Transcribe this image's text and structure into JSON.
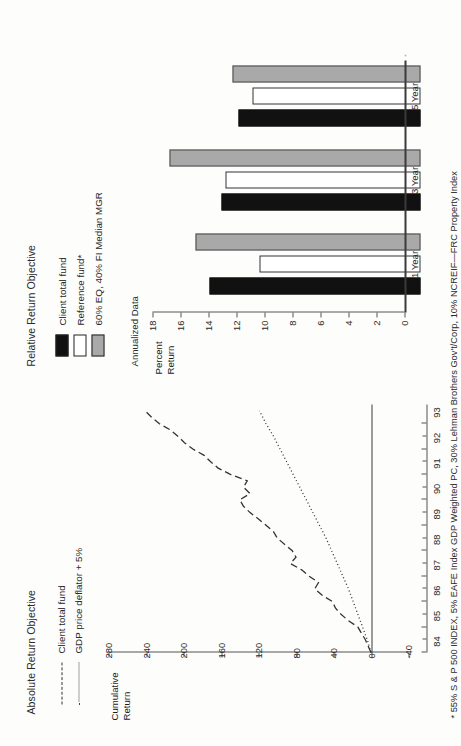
{
  "page": {
    "footnote": "* 55% S & P 500 INDEX, 5% EAFE Index GDP Weighted PC, 30% Lehman Brothers Gov't/Corp, 10% NCREIF—FRC Property Index"
  },
  "absolute_chart": {
    "title": "Absolute Return Objective",
    "ylabel_line1": "Cumulative",
    "ylabel_line2": "Return",
    "legend": [
      {
        "label": "Client total fund",
        "style": "dashed"
      },
      {
        "label": "GDP price deflator + 5%",
        "style": "dotted"
      }
    ]
  },
  "relative_chart": {
    "title": "Relative Return Objective",
    "subtitle": "Annualized Data",
    "ylabel_line1": "Percent",
    "ylabel_line2": "Return",
    "legend": [
      {
        "label": "Client total fund",
        "color": "#111111"
      },
      {
        "label": "Reference fund*",
        "color": "#ffffff"
      },
      {
        "label": "60% EQ, 40% FI Median MGR",
        "color": "#a9a9a9"
      }
    ]
  },
  "chart_data": [
    {
      "type": "line",
      "title": "Absolute Return Objective",
      "xlabel": "",
      "ylabel": "Cumulative Return",
      "ylim": [
        -40,
        280
      ],
      "yticks": [
        280,
        240,
        200,
        160,
        120,
        80,
        40,
        0,
        -40
      ],
      "xlim": [
        84,
        93.75
      ],
      "xticks": [
        84,
        85,
        86,
        87,
        88,
        89,
        90,
        91,
        92,
        93
      ],
      "xtick_labels": [
        "84",
        "85",
        "86",
        "87",
        "88",
        "89",
        "90",
        "91",
        "92",
        "93"
      ],
      "grid": false,
      "legend_position": "top-left",
      "series": [
        {
          "name": "Client total fund",
          "style": "dashed",
          "x": [
            84.0,
            84.25,
            84.5,
            84.75,
            85.0,
            85.25,
            85.5,
            85.75,
            86.0,
            86.25,
            86.5,
            86.75,
            87.0,
            87.25,
            87.5,
            87.75,
            88.0,
            88.25,
            88.5,
            88.75,
            89.0,
            89.25,
            89.5,
            89.75,
            90.0,
            90.25,
            90.5,
            90.75,
            91.0,
            91.25,
            91.5,
            91.75,
            92.0,
            92.25,
            92.5,
            92.75,
            93.0,
            93.25,
            93.5
          ],
          "y": [
            0,
            3,
            6,
            10,
            14,
            24,
            32,
            38,
            41,
            52,
            60,
            56,
            66,
            74,
            86,
            80,
            84,
            92,
            100,
            104,
            112,
            120,
            129,
            136,
            140,
            129,
            136,
            132,
            150,
            163,
            171,
            178,
            190,
            199,
            206,
            214,
            226,
            234,
            241
          ]
        },
        {
          "name": "GDP price deflator + 5%",
          "style": "dotted",
          "x": [
            84.0,
            84.5,
            85.0,
            85.5,
            86.0,
            86.5,
            87.0,
            87.5,
            88.0,
            88.5,
            89.0,
            89.5,
            90.0,
            90.5,
            91.0,
            91.5,
            92.0,
            92.5,
            93.0,
            93.5
          ],
          "y": [
            0,
            4,
            9,
            14,
            19,
            24,
            30,
            36,
            42,
            48,
            55,
            62,
            69,
            76,
            83,
            90,
            97,
            104,
            112,
            119
          ]
        }
      ]
    },
    {
      "type": "bar",
      "title": "Relative Return Objective",
      "subtitle": "Annualized Data",
      "xlabel": "",
      "ylabel": "Percent Return",
      "ylim": [
        0,
        18
      ],
      "yticks": [
        18,
        16,
        14,
        12,
        10,
        8,
        6,
        4,
        2,
        0
      ],
      "categories": [
        "1 Year",
        "3 Year",
        "5 Year"
      ],
      "grid": false,
      "legend_position": "top-left",
      "series": [
        {
          "name": "Client total fund",
          "color": "#111111",
          "values": [
            15.1,
            14.2,
            13.0
          ]
        },
        {
          "name": "Reference fund*",
          "color": "#ffffff",
          "values": [
            11.5,
            13.9,
            12.0
          ]
        },
        {
          "name": "60% EQ, 40% FI Median MGR",
          "color": "#a9a9a9",
          "values": [
            16.1,
            17.9,
            13.4
          ]
        }
      ]
    }
  ]
}
